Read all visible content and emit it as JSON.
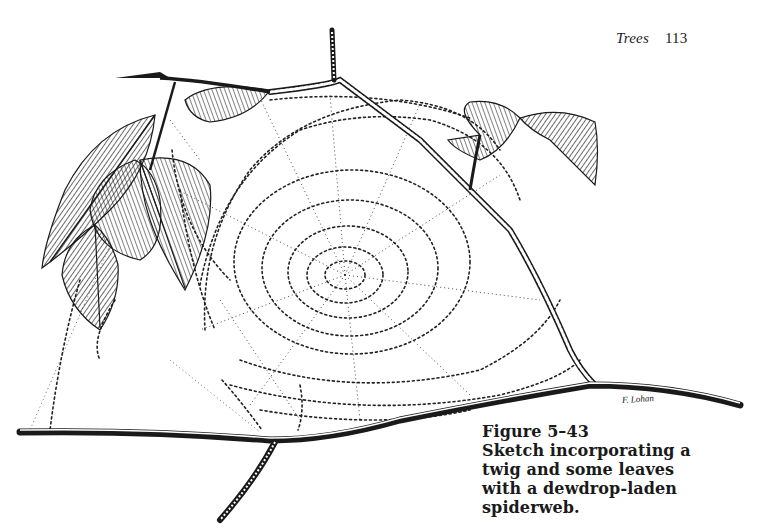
{
  "header": {
    "section_title": "Trees",
    "page_number": "113"
  },
  "illustration": {
    "subject": "twig with leaves and dewdrop-laden spiderweb",
    "artist_signature": "F. Lohan"
  },
  "caption": {
    "label": "Figure 5–43",
    "lines": [
      "Sketch incorporating a",
      "twig and some leaves",
      "with a dewdrop-laden",
      "spiderweb."
    ]
  },
  "colors": {
    "ink": "#1a1a1a",
    "paper": "#ffffff"
  }
}
